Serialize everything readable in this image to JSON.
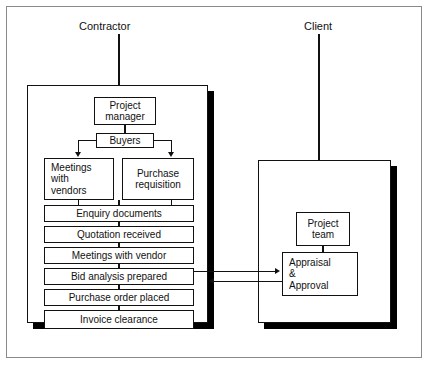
{
  "figure": {
    "background_color": "#ffffff",
    "line_color": "#111111",
    "frame_color": "#8a8a8a",
    "shadow_color": "#000000"
  },
  "groups": {
    "contractor": {
      "label": "Contractor"
    },
    "client": {
      "label": "Client"
    }
  },
  "contractor_nodes": {
    "project_manager": "Project\nmanager",
    "project_manager_line1": "Project",
    "project_manager_line2": "manager",
    "buyers": "Buyers",
    "meetings_with_vendors_line1": "Meetings",
    "meetings_with_vendors_line2": "with",
    "meetings_with_vendors_line3": "vendors",
    "purchase_requisition_line1": "Purchase",
    "purchase_requisition_line2": "requisition",
    "process_steps": [
      "Enquiry documents",
      "Quotation received",
      "Meetings with vendor",
      "Bid analysis prepared",
      "Purchase order placed",
      "Invoice clearance"
    ]
  },
  "client_nodes": {
    "project_team_line1": "Project",
    "project_team_line2": "team",
    "appraisal_line1": "Appraisal",
    "appraisal_line2": "&",
    "appraisal_line3": "Approval"
  },
  "connections": {
    "to_client_label": "",
    "from_client_label": ""
  }
}
